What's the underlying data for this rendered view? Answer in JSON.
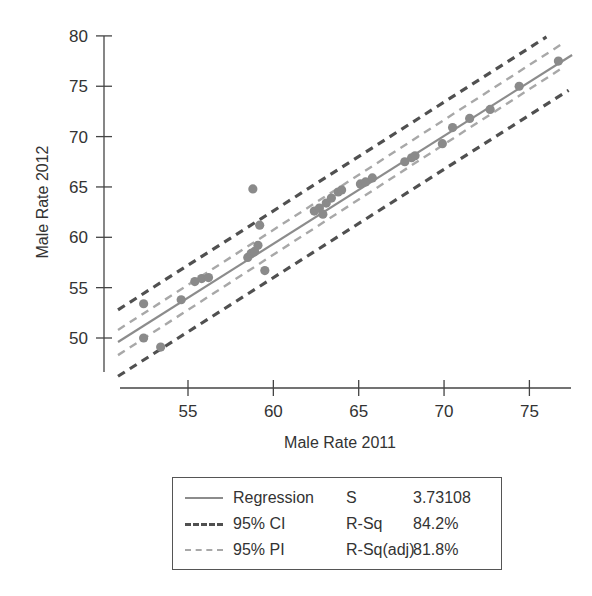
{
  "chart_data": {
    "type": "scatter",
    "title": "",
    "xlabel": "Male Rate 2011",
    "ylabel": "Male Rate 2012",
    "x_ticks": [
      55,
      60,
      65,
      70,
      75
    ],
    "y_ticks": [
      50,
      55,
      60,
      65,
      70,
      75,
      80
    ],
    "xlim": [
      50.9,
      77.5
    ],
    "ylim": [
      45.5,
      80
    ],
    "grid": false,
    "legend_position": "bottom",
    "points": [
      {
        "x": 52.4,
        "y": 53.4
      },
      {
        "x": 52.4,
        "y": 50.0
      },
      {
        "x": 53.4,
        "y": 49.1
      },
      {
        "x": 54.6,
        "y": 53.8
      },
      {
        "x": 55.4,
        "y": 55.6
      },
      {
        "x": 55.8,
        "y": 55.9
      },
      {
        "x": 56.2,
        "y": 56.0
      },
      {
        "x": 58.5,
        "y": 58.0
      },
      {
        "x": 58.7,
        "y": 58.4
      },
      {
        "x": 58.9,
        "y": 58.6
      },
      {
        "x": 59.1,
        "y": 59.2
      },
      {
        "x": 58.8,
        "y": 64.8
      },
      {
        "x": 59.2,
        "y": 61.2
      },
      {
        "x": 59.5,
        "y": 56.7
      },
      {
        "x": 62.4,
        "y": 62.6
      },
      {
        "x": 62.7,
        "y": 62.9
      },
      {
        "x": 62.9,
        "y": 62.3
      },
      {
        "x": 63.1,
        "y": 63.4
      },
      {
        "x": 63.4,
        "y": 63.9
      },
      {
        "x": 63.8,
        "y": 64.5
      },
      {
        "x": 64.0,
        "y": 64.7
      },
      {
        "x": 65.1,
        "y": 65.3
      },
      {
        "x": 65.4,
        "y": 65.5
      },
      {
        "x": 65.8,
        "y": 65.9
      },
      {
        "x": 67.7,
        "y": 67.5
      },
      {
        "x": 68.1,
        "y": 67.9
      },
      {
        "x": 68.3,
        "y": 68.1
      },
      {
        "x": 69.9,
        "y": 69.3
      },
      {
        "x": 70.5,
        "y": 70.9
      },
      {
        "x": 71.5,
        "y": 71.8
      },
      {
        "x": 72.7,
        "y": 72.7
      },
      {
        "x": 74.4,
        "y": 75.0
      },
      {
        "x": 76.7,
        "y": 77.5
      }
    ],
    "series": [
      {
        "name": "Regression",
        "style": "solid",
        "color": "#8c8c8c",
        "x": [
          50.9,
          77.5
        ],
        "y": [
          49.6,
          78.1
        ]
      },
      {
        "name": "95% CI",
        "style": "dashed",
        "color": "#505050",
        "band": "upper",
        "x": [
          50.9,
          76.0
        ],
        "y": [
          52.8,
          79.9
        ]
      },
      {
        "name": "95% CI",
        "style": "dashed",
        "color": "#505050",
        "band": "lower",
        "x": [
          50.9,
          77.3
        ],
        "y": [
          46.2,
          74.6
        ]
      },
      {
        "name": "95% PI",
        "style": "dashed",
        "color": "#a8a8a8",
        "band": "upper",
        "x": [
          50.9,
          77.0
        ],
        "y": [
          50.8,
          79.3
        ]
      },
      {
        "name": "95% PI",
        "style": "dashed",
        "color": "#a8a8a8",
        "band": "lower",
        "x": [
          50.9,
          77.0
        ],
        "y": [
          48.3,
          76.9
        ]
      }
    ],
    "stats": {
      "S": "3.73108",
      "R-Sq": "84.2%",
      "R-Sq(adj)": "81.8%"
    }
  },
  "legend": {
    "rows": [
      {
        "label": "Regression",
        "stat": "S",
        "value": "3.73108"
      },
      {
        "label": "95% CI",
        "stat": "R-Sq",
        "value": "84.2%"
      },
      {
        "label": "95% PI",
        "stat": "R-Sq(adj)",
        "value": "81.8%"
      }
    ]
  },
  "colors": {
    "regression": "#8c8c8c",
    "ci": "#505050",
    "pi": "#a8a8a8",
    "points": "#8a8a8a",
    "axis": "#444444"
  }
}
